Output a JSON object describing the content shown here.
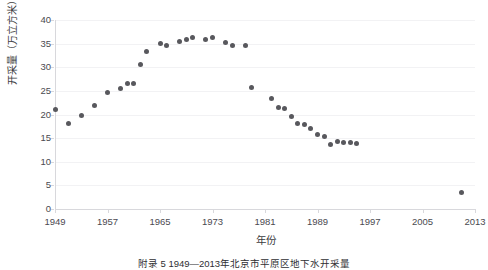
{
  "figure": {
    "caption": "附录 5   1949—2013年北京市平原区地下水开采量",
    "background_color": "#ffffff"
  },
  "chart_data": {
    "type": "scatter",
    "title": "",
    "xlabel": "年份",
    "ylabel": "开采量（万立方米）",
    "xlim": [
      1949,
      2013
    ],
    "ylim": [
      0,
      40
    ],
    "xticks": [
      1949,
      1957,
      1965,
      1973,
      1981,
      1989,
      1997,
      2005,
      2013
    ],
    "yticks": [
      0,
      5,
      10,
      15,
      20,
      25,
      30,
      35,
      40
    ],
    "grid": "horizontal",
    "legend": "none",
    "marker_color": "#58585d",
    "marker_size": 5,
    "series": [
      {
        "name": "开采量",
        "points": [
          {
            "x": 1949,
            "y": 21.0
          },
          {
            "x": 1951,
            "y": 18.2
          },
          {
            "x": 1953,
            "y": 19.7
          },
          {
            "x": 1955,
            "y": 21.8
          },
          {
            "x": 1957,
            "y": 24.7
          },
          {
            "x": 1959,
            "y": 25.6
          },
          {
            "x": 1960,
            "y": 26.6
          },
          {
            "x": 1961,
            "y": 26.6
          },
          {
            "x": 1962,
            "y": 30.5
          },
          {
            "x": 1963,
            "y": 33.3
          },
          {
            "x": 1965,
            "y": 35.0
          },
          {
            "x": 1966,
            "y": 34.5
          },
          {
            "x": 1968,
            "y": 35.4
          },
          {
            "x": 1969,
            "y": 35.8
          },
          {
            "x": 1970,
            "y": 36.3
          },
          {
            "x": 1972,
            "y": 35.9
          },
          {
            "x": 1973,
            "y": 36.4
          },
          {
            "x": 1975,
            "y": 35.2
          },
          {
            "x": 1976,
            "y": 34.7
          },
          {
            "x": 1978,
            "y": 34.6
          },
          {
            "x": 1979,
            "y": 25.7
          },
          {
            "x": 1982,
            "y": 23.3
          },
          {
            "x": 1983,
            "y": 21.4
          },
          {
            "x": 1984,
            "y": 21.3
          },
          {
            "x": 1985,
            "y": 19.6
          },
          {
            "x": 1986,
            "y": 18.0
          },
          {
            "x": 1987,
            "y": 17.9
          },
          {
            "x": 1988,
            "y": 17.0
          },
          {
            "x": 1989,
            "y": 15.8
          },
          {
            "x": 1990,
            "y": 15.4
          },
          {
            "x": 1991,
            "y": 13.7
          },
          {
            "x": 1992,
            "y": 14.2
          },
          {
            "x": 1993,
            "y": 14.1
          },
          {
            "x": 1994,
            "y": 14.0
          },
          {
            "x": 1995,
            "y": 13.9
          },
          {
            "x": 2011,
            "y": 3.5
          }
        ]
      }
    ]
  }
}
